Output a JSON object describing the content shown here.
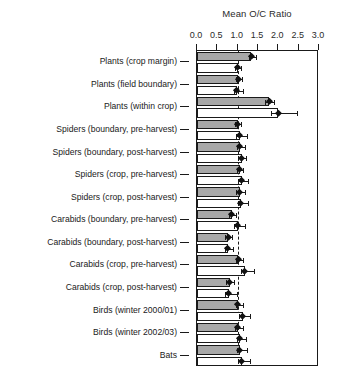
{
  "chart_data": {
    "type": "bar",
    "orientation": "horizontal",
    "title": "",
    "xlabel": "Mean O/C Ratio",
    "ylabel": "",
    "xlim": [
      0.0,
      3.0
    ],
    "xticks": [
      0.0,
      0.5,
      1.0,
      1.5,
      2.0,
      2.5,
      3.0
    ],
    "xticklabels": [
      "0.0",
      "0.5",
      "1.0",
      "1.5",
      "2.0",
      "2.5",
      "3.0"
    ],
    "grid": false,
    "reference_line": 1.0,
    "legend": [],
    "categories": [
      "Plants (crop margin)",
      "Plants (field boundary)",
      "Plants (within crop)",
      "Spiders (boundary, pre-harvest)",
      "Spiders (boundary, post-harvest)",
      "Spiders (crop, pre-harvest)",
      "Spiders (crop, post-harvest)",
      "Carabids (boundary, pre-harvest)",
      "Carabids (boundary, post-harvest)",
      "Carabids (crop, pre-harvest)",
      "Carabids (crop, post-harvest)",
      "Birds (winter 2000/01)",
      "Birds (winter 2002/03)",
      "Bats"
    ],
    "series": [
      {
        "name": "upper-bar",
        "fill": "gray",
        "values": [
          1.33,
          1.02,
          1.78,
          1.0,
          1.05,
          1.05,
          1.05,
          0.86,
          0.77,
          1.02,
          0.8,
          1.0,
          1.0,
          1.05
        ],
        "err_low": [
          1.27,
          0.97,
          1.66,
          0.93,
          0.98,
          0.99,
          0.97,
          0.79,
          0.7,
          0.96,
          0.72,
          0.96,
          0.94,
          0.98
        ],
        "err_high": [
          1.45,
          1.1,
          1.9,
          1.08,
          1.18,
          1.14,
          1.18,
          0.96,
          0.86,
          1.12,
          0.92,
          1.12,
          1.12,
          1.22
        ]
      },
      {
        "name": "lower-bar",
        "fill": "white",
        "values": [
          1.0,
          0.98,
          2.0,
          1.05,
          1.1,
          1.1,
          1.08,
          1.0,
          0.75,
          1.18,
          0.78,
          1.12,
          1.05,
          1.1
        ],
        "err_low": [
          0.94,
          0.92,
          1.82,
          0.97,
          1.02,
          1.02,
          1.0,
          0.92,
          0.68,
          1.08,
          0.7,
          1.04,
          0.98,
          1.02
        ],
        "err_high": [
          1.08,
          1.12,
          2.47,
          1.22,
          1.2,
          1.25,
          1.25,
          1.18,
          0.88,
          1.4,
          0.98,
          1.3,
          1.2,
          1.3
        ]
      }
    ]
  },
  "axis": {
    "title": "Mean O/C Ratio"
  }
}
